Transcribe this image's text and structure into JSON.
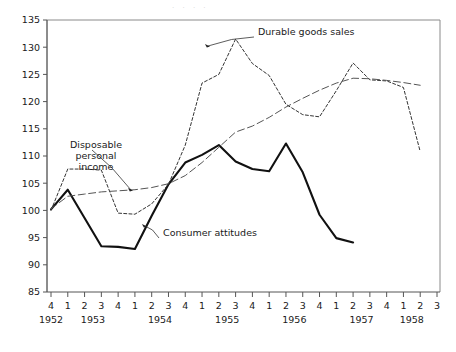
{
  "chart_data": {
    "type": "line",
    "title": "",
    "xlabel": "",
    "ylabel": "",
    "ylim": [
      85,
      135
    ],
    "ytick_step": 5,
    "yticks": [
      85,
      90,
      95,
      100,
      105,
      110,
      115,
      120,
      125,
      130,
      135
    ],
    "grid": false,
    "legend_position": "inline-annotations",
    "x_quarter_labels": [
      "4",
      "1",
      "2",
      "3",
      "4",
      "1",
      "2",
      "3",
      "4",
      "1",
      "2",
      "3",
      "4",
      "1",
      "2",
      "3",
      "4",
      "1",
      "2",
      "3",
      "4",
      "1",
      "2",
      "3"
    ],
    "x_year_groups": [
      {
        "year": "1952",
        "start_index": 0,
        "count": 1
      },
      {
        "year": "1953",
        "start_index": 1,
        "count": 4
      },
      {
        "year": "1954",
        "start_index": 5,
        "count": 4
      },
      {
        "year": "1955",
        "start_index": 9,
        "count": 4
      },
      {
        "year": "1956",
        "start_index": 13,
        "count": 4
      },
      {
        "year": "1957",
        "start_index": 17,
        "count": 4
      },
      {
        "year": "1958",
        "start_index": 21,
        "count": 2
      }
    ],
    "x": [
      "1952Q4",
      "1953Q1",
      "1953Q2",
      "1953Q3",
      "1953Q4",
      "1954Q1",
      "1954Q2",
      "1954Q3",
      "1954Q4",
      "1955Q1",
      "1955Q2",
      "1955Q3",
      "1955Q4",
      "1956Q1",
      "1956Q2",
      "1956Q3",
      "1956Q4",
      "1957Q1",
      "1957Q2",
      "1957Q3",
      "1957Q4",
      "1958Q1",
      "1958Q2"
    ],
    "series": [
      {
        "name": "Consumer attitudes",
        "style": "solid",
        "color": "#111111",
        "line_width": 2.1,
        "values": [
          100.2,
          103.8,
          98.6,
          93.4,
          93.3,
          92.9,
          99.0,
          104.8,
          108.8,
          110.2,
          112.0,
          109.0,
          107.6,
          107.2,
          112.3,
          107.0,
          99.2,
          94.9,
          94.1,
          null,
          null,
          null,
          null
        ]
      },
      {
        "name": "Durable goods sales",
        "style": "dashed-short",
        "color": "#333333",
        "line_width": 1.0,
        "values": [
          100.0,
          107.6,
          107.6,
          107.4,
          99.5,
          99.3,
          101.2,
          104.8,
          112.0,
          123.4,
          125.0,
          131.5,
          127.0,
          124.8,
          119.5,
          117.6,
          117.2,
          122.0,
          127.1,
          124.0,
          123.8,
          122.6,
          110.8
        ]
      },
      {
        "name": "Disposable personal income",
        "style": "dashed-long",
        "color": "#555555",
        "line_width": 1.0,
        "values": [
          100.3,
          102.6,
          103.0,
          103.4,
          103.6,
          103.8,
          104.2,
          104.9,
          106.4,
          108.8,
          111.6,
          114.4,
          115.5,
          117.1,
          119.0,
          120.6,
          122.1,
          123.4,
          124.3,
          124.2,
          123.9,
          123.5,
          123.0
        ]
      }
    ],
    "annotations": [
      {
        "id": "durable-goods-sales",
        "text": "Durable goods sales",
        "label_x": 258,
        "label_y": 35,
        "target_x": 205,
        "target_y": 44
      },
      {
        "id": "disposable-personal-income",
        "text": "Disposable\npersonal\nincome",
        "lines": [
          "Disposable",
          "personal",
          "income"
        ],
        "label_x": 96,
        "label_y": 148,
        "target_x": 128,
        "target_y": 188
      },
      {
        "id": "consumer-attitudes",
        "text": "Consumer attitudes",
        "label_x": 163,
        "label_y": 236,
        "target_x": 142,
        "target_y": 224
      }
    ]
  },
  "top_fragment": ". .  .  ."
}
